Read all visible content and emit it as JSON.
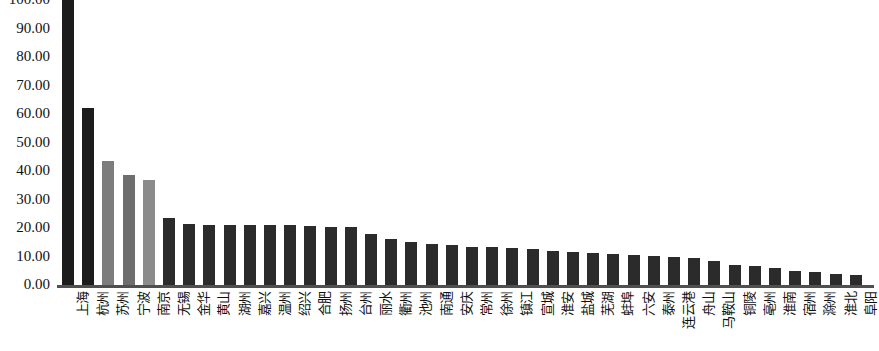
{
  "chart_data": {
    "type": "bar",
    "title": "",
    "subtitle": "",
    "xlabel": "",
    "ylabel": "",
    "ylim": [
      0,
      100
    ],
    "grid": false,
    "legend": null,
    "y_ticks": [
      "100.00",
      "90.00",
      "80.00",
      "70.00",
      "60.00",
      "50.00",
      "40.00",
      "30.00",
      "20.00",
      "10.00",
      "0.00"
    ],
    "y_tick_values": [
      100,
      90,
      80,
      70,
      60,
      50,
      40,
      30,
      20,
      10,
      0
    ],
    "categories": [
      "上海",
      "杭州",
      "苏州",
      "宁波",
      "南京",
      "无锡",
      "金华",
      "黄山",
      "湖州",
      "嘉兴",
      "温州",
      "绍兴",
      "合肥",
      "扬州",
      "台州",
      "丽水",
      "衢州",
      "池州",
      "南通",
      "安庆",
      "常州",
      "徐州",
      "镇江",
      "宣城",
      "淮安",
      "盐城",
      "芜湖",
      "蚌埠",
      "六安",
      "泰州",
      "连云港",
      "舟山",
      "马鞍山",
      "铜陵",
      "亳州",
      "淮南",
      "宿州",
      "滁州",
      "淮北",
      "阜阳"
    ],
    "values": [
      100.0,
      62.0,
      43.5,
      38.5,
      37.0,
      23.5,
      21.5,
      21.2,
      21.0,
      21.0,
      21.0,
      21.0,
      20.8,
      20.5,
      20.2,
      18.0,
      16.0,
      15.0,
      14.5,
      14.0,
      13.5,
      13.2,
      13.0,
      12.5,
      12.0,
      11.5,
      11.2,
      10.8,
      10.5,
      10.2,
      10.0,
      9.5,
      8.5,
      7.0,
      6.5,
      6.0,
      5.0,
      4.5,
      4.0,
      3.5
    ],
    "bar_colors": [
      "#1c1c1c",
      "#1c1c1c",
      "#7d7d7d",
      "#6e6e6e",
      "#8b8b8b",
      "#2b2b2b",
      "#2b2b2b",
      "#2b2b2b",
      "#2b2b2b",
      "#2b2b2b",
      "#2b2b2b",
      "#2b2b2b",
      "#2b2b2b",
      "#2b2b2b",
      "#2b2b2b",
      "#2b2b2b",
      "#2b2b2b",
      "#2b2b2b",
      "#2b2b2b",
      "#2b2b2b",
      "#2b2b2b",
      "#2b2b2b",
      "#2b2b2b",
      "#2b2b2b",
      "#2b2b2b",
      "#2b2b2b",
      "#2b2b2b",
      "#2b2b2b",
      "#2b2b2b",
      "#2b2b2b",
      "#2b2b2b",
      "#2b2b2b",
      "#2b2b2b",
      "#2b2b2b",
      "#2b2b2b",
      "#2b2b2b",
      "#2b2b2b",
      "#2b2b2b",
      "#2b2b2b",
      "#2b2b2b"
    ],
    "axis_color": "#4f4f4f",
    "background_color": "#ffffff"
  }
}
